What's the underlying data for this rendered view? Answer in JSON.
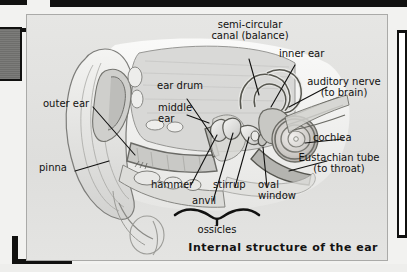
{
  "figure": {
    "caption": "Internal structure of the ear",
    "panel_bg": "#e2e2e0",
    "ink": "#111110",
    "labels": {
      "semicircular_canal": "semi-circular\ncanal (balance)",
      "inner_ear": "inner ear",
      "auditory_nerve": "auditory nerve\n(to brain)",
      "cochlea": "cochlea",
      "eustachian_tube": "Eustachian tube\n(to throat)",
      "ear_drum": "ear drum",
      "middle_ear": "middle\near",
      "outer_ear": "outer ear",
      "pinna": "pinna",
      "hammer": "hammer",
      "anvil": "anvil",
      "stirrup": "stirrup",
      "oval_window": "oval\nwindow",
      "ossicles": "ossicles"
    }
  }
}
